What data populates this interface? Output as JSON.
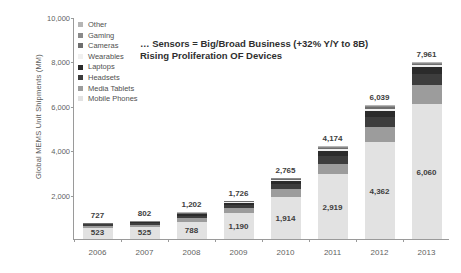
{
  "headline": {
    "line1": "… Sensors = Big/Broad Business (+32% Y/Y to 8B)",
    "line2": "Rising Proliferation OF Devices"
  },
  "chart_data": {
    "type": "bar",
    "stacked": true,
    "title": "… Sensors = Big/Broad Business (+32% Y/Y to 8B) Rising Proliferation OF Devices",
    "xlabel": "",
    "ylabel": "Global MEMS Unit Shipments (MM)",
    "ylim": [
      0,
      10000
    ],
    "yticks": [
      0,
      2000,
      4000,
      6000,
      8000,
      10000
    ],
    "ytick_labels": [
      "0",
      "2,000",
      "4,000",
      "6,000",
      "8,000",
      "10,000"
    ],
    "grid": false,
    "legend_position": "inside-top-left",
    "categories": [
      "2006",
      "2007",
      "2008",
      "2009",
      "2010",
      "2011",
      "2012",
      "2013"
    ],
    "series": [
      {
        "name": "Mobile Phones",
        "color": "#e2e2e2",
        "values": [
          523,
          525,
          788,
          1190,
          1914,
          2919,
          4362,
          6060
        ]
      },
      {
        "name": "Media Tablets",
        "color": "#9c9c9c",
        "values": [
          90,
          110,
          140,
          200,
          330,
          470,
          700,
          900
        ]
      },
      {
        "name": "Headsets",
        "color": "#3d3d3d",
        "values": [
          60,
          75,
          110,
          150,
          230,
          360,
          430,
          470
        ]
      },
      {
        "name": "Laptops",
        "color": "#2b2b2b",
        "values": [
          30,
          45,
          75,
          100,
          160,
          230,
          280,
          300
        ]
      },
      {
        "name": "Wearables",
        "color": "#f0f0f0",
        "values": [
          5,
          7,
          14,
          22,
          40,
          65,
          100,
          110
        ]
      },
      {
        "name": "Cameras",
        "color": "#6e6e6e",
        "values": [
          9,
          20,
          35,
          30,
          45,
          60,
          70,
          60
        ]
      },
      {
        "name": "Gaming",
        "color": "#8a8a8a",
        "values": [
          8,
          15,
          30,
          26,
          38,
          55,
          62,
          46
        ]
      },
      {
        "name": "Other",
        "color": "#b5b5b5",
        "values": [
          12,
          5,
          10,
          8,
          8,
          15,
          35,
          15
        ]
      }
    ],
    "totals": [
      727,
      802,
      1202,
      1726,
      2765,
      4174,
      6039,
      7961
    ],
    "total_labels": [
      "727",
      "802",
      "1,202",
      "1,726",
      "2,765",
      "4,174",
      "6,039",
      "7,961"
    ],
    "base_labels": [
      "523",
      "525",
      "788",
      "1,190",
      "1,914",
      "2,919",
      "4,362",
      "6,060"
    ]
  }
}
